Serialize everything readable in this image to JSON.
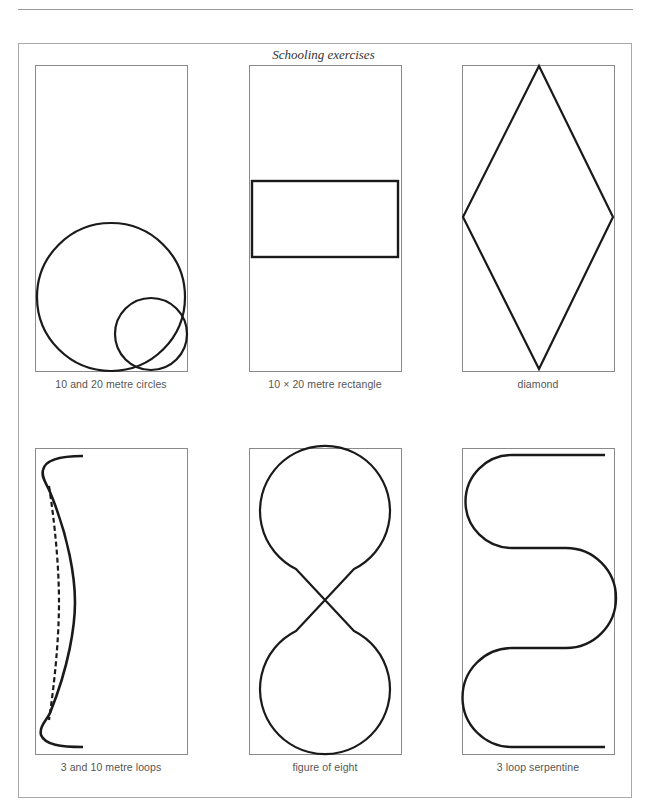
{
  "page": {
    "title": "Schooling exercises"
  },
  "diagrams": [
    {
      "id": "circles",
      "caption": "10 and 20 metre circles",
      "icon": "circles-figure-icon"
    },
    {
      "id": "rectangle",
      "caption": "10 × 20 metre rectangle",
      "icon": "rectangle-figure-icon"
    },
    {
      "id": "diamond",
      "caption": "diamond",
      "icon": "diamond-figure-icon"
    },
    {
      "id": "loops",
      "caption": "3 and 10 metre loops",
      "icon": "loops-figure-icon"
    },
    {
      "id": "figure-eight",
      "caption": "figure of eight",
      "icon": "figure-eight-icon"
    },
    {
      "id": "serpentine",
      "caption": "3 loop serpentine",
      "icon": "serpentine-figure-icon"
    }
  ],
  "colors": {
    "line": "#1a1a1a",
    "arena_border": "#8a8a8a",
    "caption_text": "#555555"
  }
}
